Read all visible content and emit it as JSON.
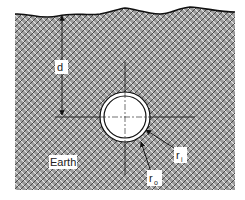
{
  "diagram": {
    "type": "buried-pipe-cross-section",
    "labels": {
      "depth": "d",
      "medium": "Earth",
      "inner_radius": "r",
      "inner_radius_sub": "i",
      "outer_radius": "r",
      "outer_radius_sub": "o"
    },
    "colors": {
      "hatch_light": "#d8d8d8",
      "hatch_dark": "#555555",
      "line": "#111111",
      "pipe_fill": "#ffffff",
      "background": "#ffffff"
    },
    "geometry": {
      "ground_left": 15,
      "ground_right": 235,
      "ground_top": 12,
      "ground_bottom": 190,
      "pipe_cx": 125,
      "pipe_cy": 117,
      "outer_r": 25,
      "inner_r": 21
    }
  }
}
